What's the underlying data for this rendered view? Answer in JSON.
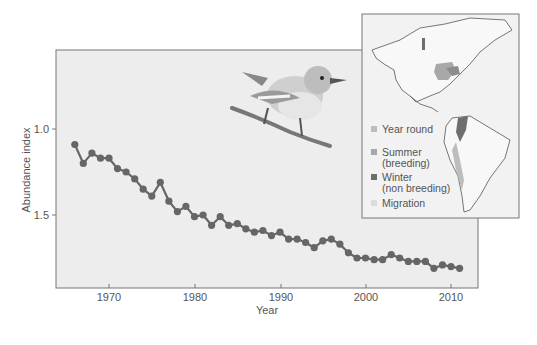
{
  "chart_data": {
    "type": "line",
    "title": "",
    "xlabel": "Year",
    "ylabel": "Abundance index",
    "x_ticks": [
      1970,
      1980,
      1990,
      2000,
      2010
    ],
    "y_ticks": [
      "1.0",
      "1.5"
    ],
    "y_inverted": true,
    "xlim": [
      1964,
      2013
    ],
    "ylim": [
      0.7,
      1.92
    ],
    "grid": false,
    "series": [
      {
        "name": "Abundance index",
        "color": "#666666",
        "x": [
          1966,
          1967,
          1968,
          1969,
          1970,
          1971,
          1972,
          1973,
          1974,
          1975,
          1976,
          1977,
          1978,
          1979,
          1980,
          1981,
          1982,
          1983,
          1984,
          1985,
          1986,
          1987,
          1988,
          1989,
          1990,
          1991,
          1992,
          1993,
          1994,
          1995,
          1996,
          1997,
          1998,
          1999,
          2000,
          2001,
          2002,
          2003,
          2004,
          2005,
          2006,
          2007,
          2008,
          2009,
          2010,
          2011
        ],
        "values": [
          1.09,
          1.2,
          1.14,
          1.17,
          1.17,
          1.23,
          1.25,
          1.29,
          1.35,
          1.39,
          1.31,
          1.42,
          1.48,
          1.45,
          1.51,
          1.5,
          1.56,
          1.51,
          1.56,
          1.55,
          1.58,
          1.6,
          1.59,
          1.62,
          1.6,
          1.64,
          1.64,
          1.66,
          1.69,
          1.65,
          1.64,
          1.67,
          1.72,
          1.75,
          1.75,
          1.76,
          1.76,
          1.73,
          1.75,
          1.77,
          1.77,
          1.77,
          1.81,
          1.79,
          1.8,
          1.81
        ]
      }
    ],
    "inset_map": {
      "legend": [
        {
          "label": "Year round",
          "color": "#bdbdbd"
        },
        {
          "label": "Summer",
          "sublabel": "(breeding)",
          "color": "#a8a8a8"
        },
        {
          "label": "Winter",
          "sublabel": "(non breeding)",
          "color": "#6e6e6e"
        },
        {
          "label": "Migration",
          "color": "#dcdcdc"
        }
      ]
    },
    "illustration": "warbler perched on branch"
  },
  "axes": {
    "xlabel": "Year",
    "ylabel": "Abundance index",
    "xticks": [
      "1970",
      "1980",
      "1990",
      "2000",
      "2010"
    ],
    "yticks": [
      "1.0",
      "1.5"
    ]
  },
  "legend": {
    "year_round": "Year round",
    "summer": "Summer",
    "summer_sub": "(breeding)",
    "winter": "Winter",
    "winter_sub": "(non breeding)",
    "migration": "Migration"
  }
}
